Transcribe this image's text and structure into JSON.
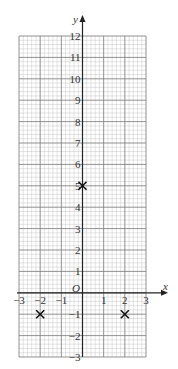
{
  "chart_data": {
    "type": "scatter",
    "title": "",
    "xlabel": "x",
    "ylabel": "y",
    "origin_label": "O",
    "xlim": [
      -3,
      3
    ],
    "ylim": [
      -3,
      12
    ],
    "x_ticks": [
      -3,
      -2,
      -1,
      1,
      2,
      3
    ],
    "x_tick_labels": [
      "−3",
      "−2",
      "−1",
      "1",
      "2",
      "3"
    ],
    "y_ticks": [
      -3,
      -2,
      -1,
      1,
      2,
      3,
      4,
      5,
      6,
      7,
      8,
      9,
      10,
      11,
      12
    ],
    "y_tick_labels": [
      "−3",
      "−2",
      "−1",
      "1",
      "2",
      "3",
      "4",
      "5",
      "6",
      "7",
      "8",
      "9",
      "10",
      "11",
      "12"
    ],
    "grid": true,
    "minor_grid_per_unit": 5,
    "marker": "x",
    "points": [
      {
        "x": 0,
        "y": 5
      },
      {
        "x": -2,
        "y": -1
      },
      {
        "x": 2,
        "y": -1
      }
    ]
  }
}
